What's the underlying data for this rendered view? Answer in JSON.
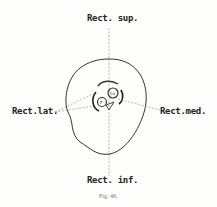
{
  "labels": {
    "top": "Rect. sup.",
    "bottom": "Rect. inf.",
    "left": "Rect.lat.",
    "right": "Rect.med."
  },
  "inner": {
    "circle_a": "Co",
    "circle_b": "P"
  },
  "caption": "Fig. 46."
}
